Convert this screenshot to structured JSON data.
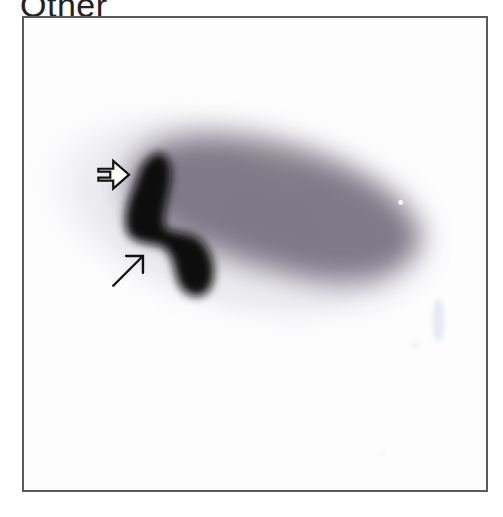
{
  "title": "Other",
  "image": {
    "description": "Grayscale nuclear medicine scan with oblong diffuse uptake and dense dark focal uptake on left",
    "annotations": [
      {
        "type": "open-arrow",
        "direction": "right",
        "label": "open-arrow-marker"
      },
      {
        "type": "line-arrow",
        "direction": "up-right",
        "label": "line-arrow-marker"
      }
    ],
    "colors": {
      "frame": "#5a5a5a",
      "background": "#fdfdfe",
      "diffuse_uptake": "#7a7485",
      "dense_uptake": "#0e0b10"
    }
  }
}
